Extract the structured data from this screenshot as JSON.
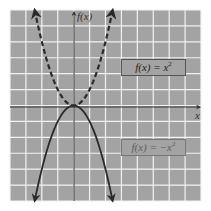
{
  "chart_data": {
    "type": "line",
    "title": "",
    "xlabel": "x",
    "ylabel": "f(x)",
    "grid": true,
    "xlim": [
      -4,
      8
    ],
    "ylim": [
      -6,
      6
    ],
    "grid_spacing": 1,
    "series": [
      {
        "name": "f(x) = x^2",
        "label": "f(x) = x²",
        "style": "dashed",
        "arrows": "both-ends",
        "x": [
          -2.45,
          -2,
          -1.5,
          -1,
          -0.5,
          0,
          0.5,
          1,
          1.5,
          2,
          2.45
        ],
        "y": [
          6.0,
          4,
          2.25,
          1,
          0.25,
          0,
          0.25,
          1,
          2.25,
          4,
          6.0
        ]
      },
      {
        "name": "f(x) = -x^2",
        "label": "f(x) = −x²",
        "style": "solid",
        "arrows": "both-ends",
        "x": [
          -2.45,
          -2,
          -1.5,
          -1,
          -0.5,
          0,
          0.5,
          1,
          1.5,
          2,
          2.45
        ],
        "y": [
          -6.0,
          -4,
          -2.25,
          -1,
          -0.25,
          0,
          -0.25,
          -1,
          -2.25,
          -4,
          -6.0
        ]
      }
    ],
    "annotations": [
      {
        "text": "f(x) = x²",
        "position": "upper-right",
        "boxed": true
      },
      {
        "text": "f(x) = −x²",
        "position": "lower-right",
        "boxed": true
      }
    ]
  },
  "labels": {
    "x_axis": "x",
    "y_axis": "f(x)",
    "upper_box_main": "f(x) = x",
    "upper_box_sup": "2",
    "lower_box_main": "f(x) = −x",
    "lower_box_sup": "2"
  },
  "colors": {
    "plot_background": "#a3a3a3",
    "grid_lines": "#f2f2f2",
    "axes": "#333333",
    "curves": "#2a2a2a"
  }
}
